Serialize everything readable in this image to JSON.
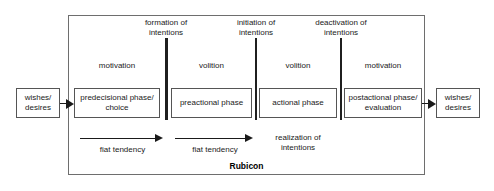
{
  "diagram": {
    "frame_label": "Rubicon",
    "colors": {
      "background": "#ffffff",
      "line": "#1a1a1a",
      "frame_border": "#6e6e6e",
      "box_border": "#555555",
      "text": "#1a1a1a"
    },
    "input_box": {
      "label": "wishes/\ndesires",
      "line1": "wishes/",
      "line2": "desires"
    },
    "output_box": {
      "label": "wishes/\ndesires",
      "line1": "wishes/",
      "line2": "desires"
    },
    "phases": [
      {
        "id": "predecisional",
        "mode": "motivation",
        "box_line1": "predecisional phase/",
        "box_line2": "choice"
      },
      {
        "id": "preactional",
        "mode": "volition",
        "box_line1": "preactional phase",
        "box_line2": ""
      },
      {
        "id": "actional",
        "mode": "volition",
        "box_line1": "actional phase",
        "box_line2": ""
      },
      {
        "id": "postactional",
        "mode": "motivation",
        "box_line1": "postactional phase/",
        "box_line2": "evaluation"
      }
    ],
    "transitions": [
      {
        "id": "formation-of-intentions",
        "line1": "formation of",
        "line2": "intentions",
        "is_rubicon": true
      },
      {
        "id": "initiation-of-intentions",
        "line1": "initiation of",
        "line2": "intentions",
        "is_rubicon": false
      },
      {
        "id": "deactivation-of-intentions",
        "line1": "deactivation of",
        "line2": "intentions",
        "is_rubicon": false
      }
    ],
    "tendencies": [
      {
        "id": "fiat-tendency-1",
        "label": "fiat tendency"
      },
      {
        "id": "fiat-tendency-2",
        "label": "fiat tendency"
      }
    ],
    "realization": {
      "line1": "realization of",
      "line2": "intentions"
    }
  }
}
